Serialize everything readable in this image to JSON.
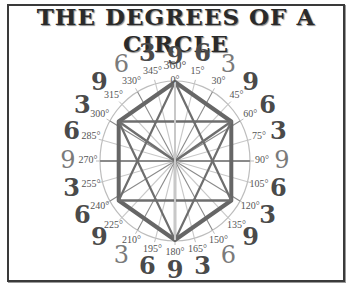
{
  "title": "THE DEGREES OF A CIRCLE",
  "diagram": {
    "center": [
      175,
      161
    ],
    "radius_x": 75,
    "radius_y": 80,
    "hexagon_vertices_degrees": [
      0,
      60,
      120,
      180,
      240,
      300
    ],
    "degree_labels": [
      "360°",
      "0°",
      "15°",
      "30°",
      "45°",
      "60°",
      "75°",
      "90°",
      "105°",
      "120°",
      "135°",
      "150°",
      "165°",
      "180°",
      "195°",
      "210°",
      "225°",
      "240°",
      "255°",
      "270°",
      "285°",
      "300°",
      "315°",
      "330°",
      "345°"
    ],
    "outer_numbers": [
      {
        "angle": 0,
        "value": "9",
        "style": "bold"
      },
      {
        "angle": 15,
        "value": "6",
        "style": "bold"
      },
      {
        "angle": 30,
        "value": "3",
        "style": "light"
      },
      {
        "angle": 45,
        "value": "9",
        "style": "bold"
      },
      {
        "angle": 60,
        "value": "6",
        "style": "bold"
      },
      {
        "angle": 75,
        "value": "3",
        "style": "bold"
      },
      {
        "angle": 90,
        "value": "9",
        "style": "light"
      },
      {
        "angle": 105,
        "value": "6",
        "style": "bold"
      },
      {
        "angle": 120,
        "value": "3",
        "style": "bold"
      },
      {
        "angle": 135,
        "value": "9",
        "style": "bold"
      },
      {
        "angle": 150,
        "value": "6",
        "style": "light"
      },
      {
        "angle": 165,
        "value": "3",
        "style": "bold"
      },
      {
        "angle": 180,
        "value": "9",
        "style": "bold"
      },
      {
        "angle": 195,
        "value": "6",
        "style": "bold"
      },
      {
        "angle": 210,
        "value": "3",
        "style": "light"
      },
      {
        "angle": 225,
        "value": "9",
        "style": "bold"
      },
      {
        "angle": 240,
        "value": "6",
        "style": "bold"
      },
      {
        "angle": 255,
        "value": "3",
        "style": "bold"
      },
      {
        "angle": 270,
        "value": "9",
        "style": "light"
      },
      {
        "angle": 285,
        "value": "6",
        "style": "bold"
      },
      {
        "angle": 300,
        "value": "3",
        "style": "bold"
      },
      {
        "angle": 315,
        "value": "9",
        "style": "bold"
      },
      {
        "angle": 330,
        "value": "6",
        "style": "light"
      },
      {
        "angle": 345,
        "value": "3",
        "style": "bold"
      }
    ],
    "colors": {
      "hexagon": "#666666",
      "star": "#6e6e6e",
      "spokes_dark": "#8a8a8a",
      "spokes_light": "#c8c8c8",
      "circle": "#bdbdbd",
      "frame": "#3a3a3a"
    }
  }
}
